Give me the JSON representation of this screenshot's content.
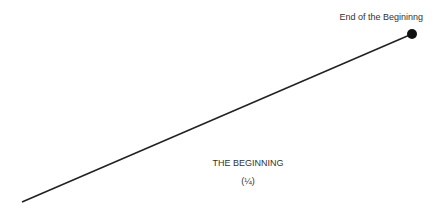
{
  "diagram": {
    "end_label": "End of the Begininng",
    "title": "THE BEGINNING",
    "subtitle": "(¼)",
    "line": {
      "x1": 22,
      "y1": 202,
      "x2": 412,
      "y2": 34,
      "color": "#222222"
    },
    "endpoint": {
      "cx": 412,
      "cy": 34,
      "r": 5,
      "color": "#111111"
    }
  }
}
